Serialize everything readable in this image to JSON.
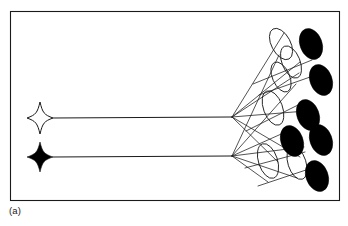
{
  "figure": {
    "caption": "(a)",
    "type": "schematic-diagram",
    "background_color": "#ffffff",
    "stroke_color": "#1a1a1a",
    "fill_black": "#000000",
    "fill_white": "#ffffff",
    "frame": {
      "x": 10.5,
      "y": 11.5,
      "width": 329,
      "height": 189,
      "stroke_width": 1.1
    },
    "sources": [
      {
        "name": "source-star-hollow",
        "style": "hollow",
        "cx": 40,
        "cy": 118,
        "rx": 13,
        "ry": 16
      },
      {
        "name": "source-star-filled",
        "style": "filled",
        "cx": 40,
        "cy": 157,
        "rx": 13,
        "ry": 15
      }
    ],
    "nodes": [
      {
        "name": "branch-node-upper",
        "cx": 232,
        "cy": 117
      },
      {
        "name": "branch-node-lower",
        "cx": 232,
        "cy": 156
      }
    ],
    "leads": [
      {
        "name": "lead-upper",
        "x1": 53,
        "y1": 118,
        "x2": 232,
        "y2": 117
      },
      {
        "name": "lead-lower",
        "x1": 53,
        "y1": 157,
        "x2": 232,
        "y2": 156
      }
    ],
    "hollow_ellipses": [
      {
        "name": "hollow-ellipse-1",
        "cx": 281,
        "cy": 44,
        "rx": 9.5,
        "ry": 17,
        "rotate": -28
      },
      {
        "name": "hollow-ellipse-2",
        "cx": 291,
        "cy": 62,
        "rx": 9,
        "ry": 17,
        "rotate": -22
      },
      {
        "name": "hollow-ellipse-3",
        "cx": 273,
        "cy": 108,
        "rx": 9.5,
        "ry": 18,
        "rotate": -20
      },
      {
        "name": "hollow-ellipse-4",
        "cx": 268,
        "cy": 161,
        "rx": 9.5,
        "ry": 18,
        "rotate": -18
      },
      {
        "name": "hollow-ellipse-5",
        "cx": 297,
        "cy": 163,
        "rx": 9,
        "ry": 17,
        "rotate": -18
      },
      {
        "name": "hollow-ellipse-6",
        "cx": 281,
        "cy": 77,
        "rx": 8.5,
        "ry": 16,
        "rotate": -24
      }
    ],
    "black_ellipses": [
      {
        "name": "black-ellipse-1",
        "cx": 311,
        "cy": 44,
        "rx": 11,
        "ry": 16,
        "rotate": -20
      },
      {
        "name": "black-ellipse-2",
        "cx": 321,
        "cy": 80,
        "rx": 11,
        "ry": 16,
        "rotate": -20
      },
      {
        "name": "black-ellipse-3",
        "cx": 308,
        "cy": 115,
        "rx": 11,
        "ry": 16,
        "rotate": -20
      },
      {
        "name": "black-ellipse-4",
        "cx": 321,
        "cy": 140,
        "rx": 11,
        "ry": 16,
        "rotate": -20
      },
      {
        "name": "black-ellipse-5",
        "cx": 292,
        "cy": 141,
        "rx": 11,
        "ry": 16,
        "rotate": -20
      },
      {
        "name": "black-ellipse-6",
        "cx": 317,
        "cy": 176,
        "rx": 11,
        "ry": 16,
        "rotate": -20
      }
    ],
    "fan_edges": [
      {
        "name": "edge-upper-to-e1",
        "x1": 232,
        "y1": 117,
        "x2": 284,
        "y2": 33
      },
      {
        "name": "edge-upper-to-e2",
        "x1": 232,
        "y1": 117,
        "x2": 299,
        "y2": 73
      },
      {
        "name": "edge-upper-to-e3",
        "x1": 232,
        "y1": 117,
        "x2": 300,
        "y2": 62
      },
      {
        "name": "edge-upper-to-e4",
        "x1": 232,
        "y1": 117,
        "x2": 306,
        "y2": 111
      },
      {
        "name": "edge-upper-to-e5",
        "x1": 232,
        "y1": 117,
        "x2": 278,
        "y2": 162
      },
      {
        "name": "edge-upper-to-e6",
        "x1": 232,
        "y1": 117,
        "x2": 300,
        "y2": 157
      },
      {
        "name": "edge-lower-to-e1",
        "x1": 232,
        "y1": 156,
        "x2": 279,
        "y2": 55
      },
      {
        "name": "edge-lower-to-e2",
        "x1": 232,
        "y1": 156,
        "x2": 296,
        "y2": 84
      },
      {
        "name": "edge-lower-to-e3",
        "x1": 232,
        "y1": 156,
        "x2": 288,
        "y2": 131
      },
      {
        "name": "edge-lower-to-e4",
        "x1": 232,
        "y1": 156,
        "x2": 304,
        "y2": 147
      },
      {
        "name": "edge-lower-to-e5",
        "x1": 232,
        "y1": 156,
        "x2": 297,
        "y2": 178
      },
      {
        "name": "edge-lower-to-e6",
        "x1": 232,
        "y1": 156,
        "x2": 268,
        "y2": 182
      }
    ],
    "cross_edges": [
      {
        "name": "cross-edge-1",
        "x1": 253,
        "y1": 84,
        "x2": 312,
        "y2": 60
      },
      {
        "name": "cross-edge-2",
        "x1": 246,
        "y1": 131,
        "x2": 306,
        "y2": 101
      },
      {
        "name": "cross-edge-3",
        "x1": 245,
        "y1": 168,
        "x2": 305,
        "y2": 152
      },
      {
        "name": "cross-edge-4",
        "x1": 258,
        "y1": 186,
        "x2": 318,
        "y2": 166
      },
      {
        "name": "cross-edge-5",
        "x1": 259,
        "y1": 95,
        "x2": 313,
        "y2": 76
      }
    ]
  }
}
